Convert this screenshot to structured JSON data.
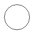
{
  "canvas": {
    "width": 35,
    "height": 49,
    "background_color": "#ffffff",
    "label": "Circle outline glyph"
  },
  "shape": {
    "name": "circle-outline-icon",
    "type": "circle",
    "center_x": 17,
    "center_y": 17.2,
    "radius": 12.6,
    "stroke_color": "#8c8c8c",
    "stroke_width": 1,
    "fill": "none",
    "bounds": {
      "left": 4.4,
      "top": 4.6,
      "right": 29.6,
      "bottom": 29.8
    }
  },
  "empty_region": {
    "name": "blank-area-below",
    "top": 33,
    "height": 16,
    "color": "#ffffff"
  }
}
